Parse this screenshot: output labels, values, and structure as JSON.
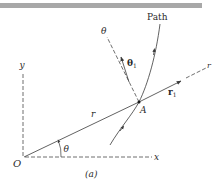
{
  "figure": {
    "caption": "(a)",
    "top_bar_color": "#9a9a9a",
    "line_color": "#3a3a3a"
  },
  "labels": {
    "path": "Path",
    "theta_axis": "θ",
    "theta_unit_vector": "θ",
    "theta_unit_sub": "1",
    "r_axis": "r",
    "r_unit_vector": "r",
    "r_unit_sub": "1",
    "point_a": "A",
    "radius": "r",
    "angle": "θ",
    "origin": "O",
    "x_axis": "x",
    "y_axis": "y"
  }
}
